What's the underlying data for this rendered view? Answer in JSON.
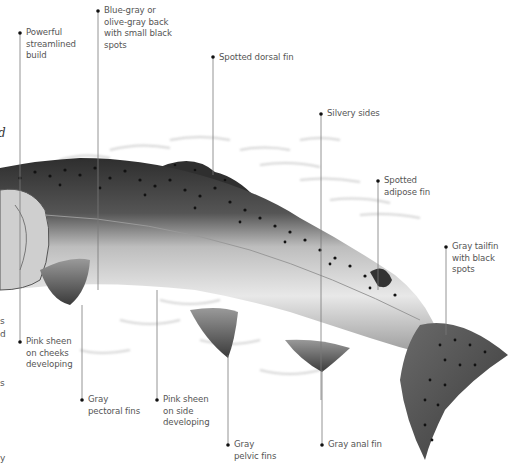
{
  "figure": {
    "annotations": [
      {
        "id": "build",
        "text": "Powerful\nstreamlined\nbuild",
        "dot": [
          20,
          33
        ],
        "line_to": [
          20,
          300
        ],
        "label_pos": [
          26,
          27
        ]
      },
      {
        "id": "back",
        "text": "Blue-gray or\nolive-gray back\nwith small black\nspots",
        "dot": [
          98,
          11
        ],
        "line_to": [
          98,
          290
        ],
        "label_pos": [
          104,
          5
        ]
      },
      {
        "id": "dorsal",
        "text": "Spotted dorsal fin",
        "dot": [
          213,
          57
        ],
        "line_to": [
          213,
          175
        ],
        "label_pos": [
          219,
          52
        ]
      },
      {
        "id": "sides",
        "text": "Silvery sides",
        "dot": [
          321,
          114
        ],
        "line_to": [
          321,
          400
        ],
        "label_pos": [
          327,
          108
        ]
      },
      {
        "id": "adipose",
        "text": "Spotted\nadipose fin",
        "dot": [
          378,
          181
        ],
        "line_to": [
          378,
          290
        ],
        "label_pos": [
          384,
          175
        ]
      },
      {
        "id": "tailfin",
        "text": "Gray tailfin\nwith black spots",
        "dot": [
          446,
          247
        ],
        "line_to": [
          446,
          335
        ],
        "label_pos": [
          452,
          241
        ]
      },
      {
        "id": "cheeks",
        "text": "Pink sheen\non cheeks\ndeveloping",
        "dot": [
          20,
          342
        ],
        "line_to": null,
        "label_pos": [
          26,
          336
        ]
      },
      {
        "id": "pectoral",
        "text": "Gray\npectoral fins",
        "dot": [
          82,
          400
        ],
        "line_to": [
          82,
          305
        ],
        "label_pos": [
          88,
          394
        ]
      },
      {
        "id": "side_pink",
        "text": "Pink sheen\non side\ndeveloping",
        "dot": [
          157,
          400
        ],
        "line_to": [
          157,
          290
        ],
        "label_pos": [
          163,
          394
        ]
      },
      {
        "id": "pelvic",
        "text": "Gray\npelvic fins",
        "dot": [
          228,
          445
        ],
        "line_to": [
          228,
          355
        ],
        "label_pos": [
          234,
          439
        ]
      },
      {
        "id": "anal",
        "text": "Gray anal fin",
        "dot": [
          322,
          445
        ],
        "line_to": [
          322,
          370
        ],
        "label_pos": [
          328,
          439
        ]
      }
    ],
    "edge_fragments": [
      {
        "text": "d",
        "pos": [
          0,
          128
        ],
        "style": "italic"
      },
      {
        "text": "s",
        "pos": [
          0,
          318
        ],
        "style": "normal"
      },
      {
        "text": "d",
        "pos": [
          0,
          331
        ],
        "style": "normal"
      },
      {
        "text": "s",
        "pos": [
          0,
          380
        ],
        "style": "normal"
      },
      {
        "text": "y",
        "pos": [
          0,
          455
        ],
        "style": "normal"
      }
    ],
    "colors": {
      "label_text": "#555555",
      "leader_line": "#7a7a7a",
      "dot": "#111111",
      "fish_dark": "#2a2a2a",
      "fish_mid": "#8a8a8a",
      "fish_light": "#e6e6e6"
    }
  }
}
